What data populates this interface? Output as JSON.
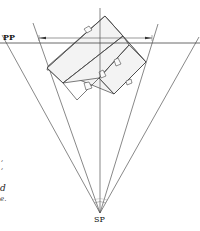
{
  "diagram": {
    "type": "two-point perspective plan setup",
    "labels": {
      "picture_plane": "PP",
      "station_point": "SP"
    },
    "text_fragments": [
      ",",
      ",",
      "d",
      "e."
    ],
    "colors": {
      "line": "#555555",
      "object_fill": "#f2f2f2",
      "object_stroke": "#444444",
      "background": "#ffffff"
    }
  }
}
